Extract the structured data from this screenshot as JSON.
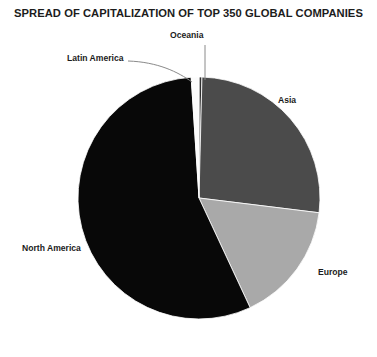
{
  "chart_data": {
    "type": "pie",
    "title": "SPREAD OF CAPITALIZATION OF TOP 350 GLOBAL COMPANIES",
    "xlabel": "",
    "ylabel": "",
    "legend": "none",
    "grid": false,
    "categories": [
      "Oceania",
      "Asia",
      "Europe",
      "North America",
      "Latin America"
    ],
    "values": [
      0.4,
      26.8,
      16.1,
      55.9,
      0.8
    ],
    "start_angle_deg": 0,
    "direction": "clockwise",
    "colors": [
      "#2f2f2f",
      "#4b4b4b",
      "#a9a9a9",
      "#080808",
      "#fbfbfb"
    ],
    "slices": [
      {
        "label": "Oceania",
        "value": 0.4,
        "color": "#2f2f2f",
        "start_deg": 0.0,
        "end_deg": 1.4
      },
      {
        "label": "Asia",
        "value": 26.8,
        "color": "#4b4b4b",
        "start_deg": 1.4,
        "end_deg": 97.0
      },
      {
        "label": "Europe",
        "value": 16.1,
        "color": "#a9a9a9",
        "start_deg": 97.0,
        "end_deg": 155.0
      },
      {
        "label": "North America",
        "value": 55.9,
        "color": "#080808",
        "start_deg": 155.0,
        "end_deg": 356.3
      },
      {
        "label": "Latin America",
        "value": 0.8,
        "color": "#fbfbfb",
        "start_deg": 356.3,
        "end_deg": 360.0
      }
    ],
    "geometry": {
      "cx": 199,
      "cy": 198,
      "r": 121
    }
  },
  "labels": {
    "oceania": "Oceania",
    "latin_america": "Latin America",
    "asia": "Asia",
    "europe": "Europe",
    "north_america": "North America"
  },
  "colors": {
    "background": "#ffffff",
    "text": "#1b1b1b",
    "leader_line": "#8a8a8a",
    "asia": "#4b4b4b",
    "europe": "#a9a9a9",
    "north_america": "#080808",
    "oceania": "#2f2f2f",
    "latin_america": "#fbfbfb"
  }
}
